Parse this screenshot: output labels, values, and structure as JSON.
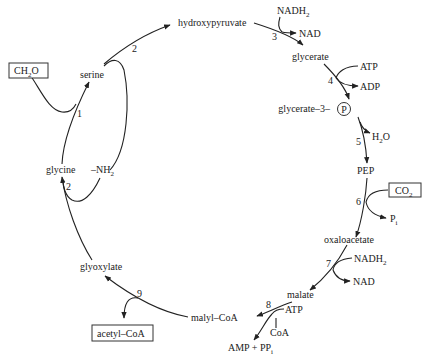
{
  "metabolites": {
    "hydroxypyruvate": "hydroxypyruvate",
    "glycerate": "glycerate",
    "glycerate3p": "glycerate–3–",
    "phosphate_circle": "P",
    "pep": "PEP",
    "oxaloacetate": "oxaloacetate",
    "malate": "malate",
    "malylcoa": "malyl–CoA",
    "glyoxylate": "glyoxylate",
    "glycine": "glycine",
    "serine": "serine",
    "nh2": "–NH",
    "nh2_sub": "2"
  },
  "boxed": {
    "ch2o": "CH",
    "ch2o_sub": "2",
    "ch2o_tail": "O",
    "co2": "CO",
    "co2_sub": "2",
    "acetylcoa": "acetyl–CoA"
  },
  "cofactors": {
    "nadh2_top": "NADH",
    "nadh2_top_sub": "2",
    "nad_top": "NAD",
    "atp_4": "ATP",
    "adp_4": "ADP",
    "h2o": "H",
    "h2o_sub": "2",
    "h2o_tail": "O",
    "pi": "P",
    "pi_sub": "i",
    "nadh2_7": "NADH",
    "nadh2_7_sub": "2",
    "nad_7": "NAD",
    "atp_8": "ATP",
    "coa_8": "CoA",
    "amp_pp": "AMP + PP",
    "amp_pp_sub": "i"
  },
  "steps": [
    "1",
    "2",
    "3",
    "4",
    "5",
    "6",
    "7",
    "8",
    "9",
    "2"
  ]
}
